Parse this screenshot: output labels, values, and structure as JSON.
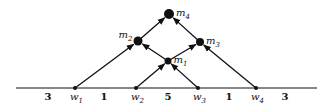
{
  "diagram": {
    "type": "directed-graph-on-line",
    "baseline": {
      "x1": 16,
      "x2": 317,
      "y": 88
    },
    "bottom_nodes": [
      {
        "id": "w1",
        "base": "w",
        "sub": "1",
        "x": 75,
        "y": 88
      },
      {
        "id": "w2",
        "base": "w",
        "sub": "2",
        "x": 136,
        "y": 88
      },
      {
        "id": "w3",
        "base": "w",
        "sub": "3",
        "x": 198,
        "y": 88
      },
      {
        "id": "w4",
        "base": "w",
        "sub": "4",
        "x": 256,
        "y": 88
      }
    ],
    "internal_nodes": [
      {
        "id": "m1",
        "base": "m",
        "sub": "1",
        "x": 168,
        "y": 61,
        "r": 3.5,
        "label_pos": "right"
      },
      {
        "id": "m2",
        "base": "m",
        "sub": "2",
        "x": 138,
        "y": 41,
        "r": 4.5,
        "label_pos": "left"
      },
      {
        "id": "m3",
        "base": "m",
        "sub": "3",
        "x": 200,
        "y": 42,
        "r": 4,
        "label_pos": "right"
      },
      {
        "id": "m4",
        "base": "m",
        "sub": "4",
        "x": 169,
        "y": 14,
        "r": 5,
        "label_pos": "right"
      }
    ],
    "edges": [
      {
        "from": "w1",
        "to": "m2"
      },
      {
        "from": "w2",
        "to": "m1"
      },
      {
        "from": "w3",
        "to": "m1"
      },
      {
        "from": "w4",
        "to": "m3"
      },
      {
        "from": "m1",
        "to": "m2"
      },
      {
        "from": "m1",
        "to": "m3"
      },
      {
        "from": "m2",
        "to": "m4"
      },
      {
        "from": "m3",
        "to": "m4"
      }
    ],
    "segment_weights": [
      {
        "value": "3",
        "x": 48
      },
      {
        "value": "1",
        "x": 104
      },
      {
        "value": "5",
        "x": 168
      },
      {
        "value": "1",
        "x": 229
      },
      {
        "value": "3",
        "x": 285
      }
    ],
    "colors": {
      "stroke": "#111111",
      "background": "#ffffff"
    }
  }
}
